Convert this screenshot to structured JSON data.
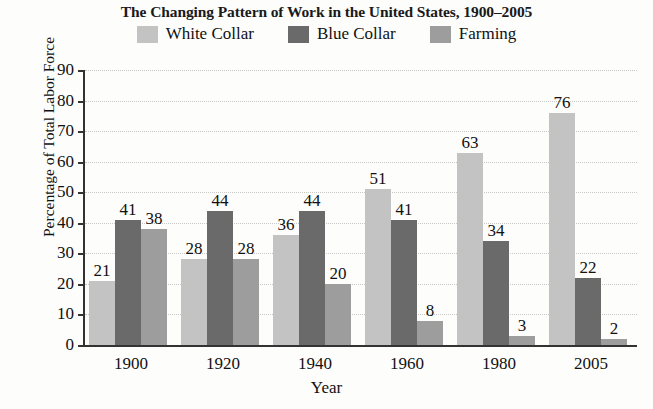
{
  "chart_data": {
    "type": "bar",
    "title": "The Changing Pattern of Work in the United States, 1900–2005",
    "xlabel": "Year",
    "ylabel": "Percentage of Total Labor Force",
    "categories": [
      "1900",
      "1920",
      "1940",
      "1960",
      "1980",
      "2005"
    ],
    "series": [
      {
        "name": "White Collar",
        "color": "#c3c3c3",
        "values": [
          21,
          28,
          36,
          51,
          63,
          76
        ]
      },
      {
        "name": "Blue Collar",
        "color": "#6a6a6a",
        "values": [
          41,
          44,
          44,
          41,
          34,
          22
        ]
      },
      {
        "name": "Farming",
        "color": "#9d9d9d",
        "values": [
          38,
          28,
          20,
          8,
          3,
          2
        ]
      }
    ],
    "ylim": [
      0,
      90
    ],
    "yticks": [
      0,
      10,
      20,
      30,
      40,
      50,
      60,
      70,
      80,
      90
    ],
    "ytick_labels": [
      "0",
      "10",
      "20",
      "30",
      "40",
      "50",
      "60",
      "70",
      "80",
      "90"
    ],
    "grid": true,
    "data_labels": true,
    "legend_position": "top"
  },
  "legend": {
    "items": [
      {
        "label": "White Collar",
        "swatch": "legend-swatch-white-collar"
      },
      {
        "label": "Blue Collar",
        "swatch": "legend-swatch-blue-collar"
      },
      {
        "label": "Farming",
        "swatch": "legend-swatch-farming"
      }
    ]
  }
}
